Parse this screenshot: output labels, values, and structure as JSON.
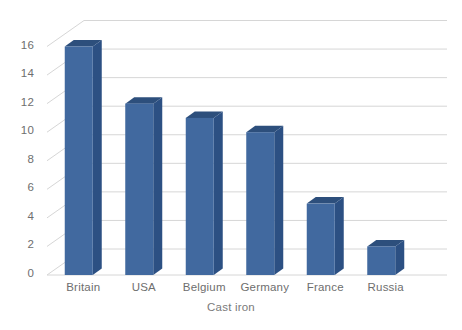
{
  "chart_data": {
    "type": "bar",
    "title": "",
    "xlabel": "Cast iron",
    "ylabel": "",
    "categories": [
      "Britain",
      "USA",
      "Belgium",
      "Germany",
      "France",
      "Russia"
    ],
    "values": [
      16,
      12,
      11,
      10,
      5,
      2
    ],
    "yticks": [
      0,
      2,
      4,
      6,
      8,
      10,
      12,
      14,
      16
    ],
    "ytick_labels": [
      "0",
      "2",
      "4",
      "6",
      "8",
      "10",
      "12",
      "14",
      "16"
    ],
    "ylim": [
      0,
      16
    ],
    "grid": true,
    "legend": false,
    "style": "3d-column",
    "colors": {
      "bar_front": "#41699f",
      "bar_side": "#2c5083",
      "bar_top": "#2d4f7c",
      "gridline": "#d6d6d6",
      "text": "#6e6e6e",
      "background": "#ffffff"
    }
  },
  "axis": {
    "x_title": "Cast iron"
  }
}
